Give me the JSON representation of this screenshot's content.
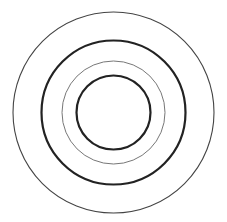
{
  "diagram": {
    "type": "concentric-circles",
    "center": {
      "x": 113.5,
      "y": 112.5
    },
    "background": "#ffffff",
    "circles": [
      {
        "name": "outer-ring",
        "r": 100.5,
        "stroke": "#444444",
        "stroke_width": 1.1
      },
      {
        "name": "second-ring",
        "r": 72,
        "stroke": "#222222",
        "stroke_width": 2.2
      },
      {
        "name": "third-ring",
        "r": 51.5,
        "stroke": "#777777",
        "stroke_width": 1
      },
      {
        "name": "inner-ring",
        "r": 37,
        "stroke": "#222222",
        "stroke_width": 2.2
      }
    ]
  }
}
